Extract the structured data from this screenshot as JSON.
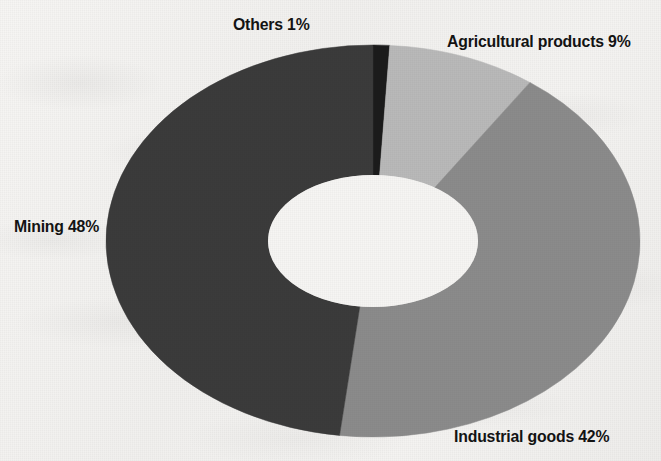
{
  "chart_data": {
    "type": "pie",
    "variant": "donut",
    "title": "",
    "subtitle": "",
    "xlabel": "",
    "ylabel": "",
    "legend_position": "none",
    "grid": false,
    "units": "percent",
    "total": 100,
    "start_angle_deg": 0,
    "direction": "clockwise",
    "categories": [
      "Others",
      "Agricultural products",
      "Industrial goods",
      "Mining"
    ],
    "values": [
      1,
      9,
      42,
      48
    ],
    "labels": [
      "Others 1%",
      "Agricultural products 9%",
      "Industrial goods 42%",
      "Mining 48%"
    ],
    "colors": [
      "#1b1b1b",
      "#b9b9b9",
      "#8b8b8b",
      "#3b3b3b"
    ],
    "slices": [
      {
        "name": "Others",
        "value": 1,
        "label": "Others 1%",
        "color": "#1b1b1b",
        "label_position": "top-center"
      },
      {
        "name": "Agricultural products",
        "value": 9,
        "label": "Agricultural products 9%",
        "color": "#b9b9b9",
        "label_position": "top-right"
      },
      {
        "name": "Industrial goods",
        "value": 42,
        "label": "Industrial goods 42%",
        "color": "#8b8b8b",
        "label_position": "bottom-right"
      },
      {
        "name": "Mining",
        "value": 48,
        "label": "Mining 48%",
        "color": "#3b3b3b",
        "label_position": "middle-left"
      }
    ]
  },
  "figure": {
    "background_color": "#f3f2f0",
    "hole_color": "#f6f5f3",
    "label_color": "#131313",
    "center_x": 373,
    "center_y": 241,
    "outer_radius_x": 267,
    "outer_radius_y": 196,
    "inner_radius_x": 105,
    "inner_radius_y": 66
  },
  "labels": {
    "others": "Others 1%",
    "agricultural": "Agricultural products 9%",
    "industrial": "Industrial goods 42%",
    "mining": "Mining 48%"
  }
}
